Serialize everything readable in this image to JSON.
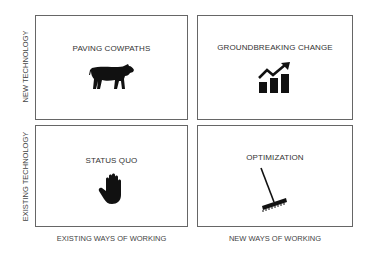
{
  "diagram": {
    "type": "2x2 matrix",
    "y_axis": {
      "top_label": "NEW TECHNOLOGY",
      "bottom_label": "EXISTING TECHNOLOGY"
    },
    "x_axis": {
      "left_label": "EXISTING WAYS OF WORKING",
      "right_label": "NEW WAYS OF WORKING"
    },
    "quadrants": [
      {
        "position": "top-left",
        "title": "PAVING COWPATHS",
        "icon": "cow-icon"
      },
      {
        "position": "top-right",
        "title": "GROUNDBREAKING CHANGE",
        "icon": "growth-chart-icon"
      },
      {
        "position": "bottom-left",
        "title": "STATUS QUO",
        "icon": "hand-stop-icon"
      },
      {
        "position": "bottom-right",
        "title": "OPTIMIZATION",
        "icon": "rake-icon"
      }
    ]
  }
}
